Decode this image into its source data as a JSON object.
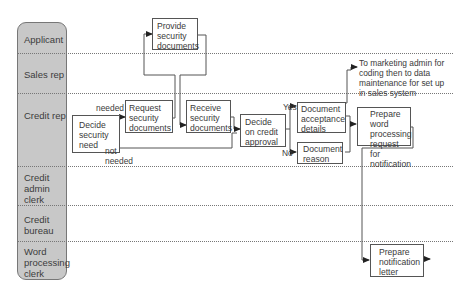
{
  "lanes": [
    {
      "label": "Applicant"
    },
    {
      "label": "Sales rep"
    },
    {
      "label": "Credit rep"
    },
    {
      "label": "Credit admin clerk"
    },
    {
      "label": "Credit bureau"
    },
    {
      "label": "Word processing clerk"
    }
  ],
  "steps": {
    "provide_security_documents": "Provide security documents",
    "decide_security_need": "Decide security need",
    "request_security_documents": "Request security documents",
    "receive_security_documents": "Receive security documents",
    "decide_on_credit_approval": "Decide on credit approval",
    "document_acceptance_details": "Document acceptance details",
    "document_reason": "Document reason",
    "prepare_word_processing_request": "Prepare word processing request for notification",
    "prepare_notification_letter": "Prepare notification letter"
  },
  "edge_labels": {
    "needed": "needed",
    "not_needed": "not needed",
    "yes": "Yes",
    "no": "No"
  },
  "notes": {
    "to_marketing_admin": "To marketing admin for coding then to data maintenance for set up in sales system"
  },
  "colors": {
    "lane_header_bg": "#c8c8c8",
    "line": "#555555",
    "text": "#3a3a3a"
  }
}
